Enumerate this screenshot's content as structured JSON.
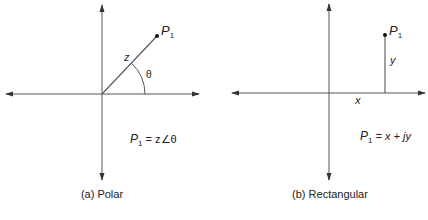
{
  "polar": {
    "point_label": "P",
    "point_sub": "1",
    "magnitude_label": "z",
    "angle_label": "θ",
    "formula": {
      "lhs": "P",
      "lhs_sub": "1",
      "rhs": " = z∠θ"
    },
    "caption": "(a) Polar"
  },
  "rectangular": {
    "point_label": "P",
    "point_sub": "1",
    "x_label": "x",
    "y_label": "y",
    "formula": {
      "lhs": "P",
      "lhs_sub": "1",
      "rhs": " = x + jy"
    },
    "caption": "(b) Rectangular"
  },
  "colors": {
    "line": "#555555",
    "text": "#222222"
  }
}
